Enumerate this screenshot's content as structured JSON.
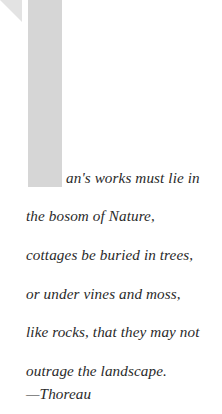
{
  "page": {
    "background_color": "#ffffff",
    "width": 222,
    "height": 414
  },
  "dropcap": {
    "letter": "M",
    "color": "#d6d6d6",
    "flourish_color": "#e3e3e3"
  },
  "quote": {
    "text_color": "#2a2a2a",
    "full_text": "Man's works must lie in the bosom of Nature, cottages be buried in trees, or under vines and moss, like rocks, that they may not outrage the landscape.",
    "lines": [
      "an's works must lie in",
      "the bosom of Nature,",
      "cottages be buried in trees,",
      "or under vines and moss,",
      "like rocks, that they may not",
      "outrage the landscape."
    ],
    "attribution": "—Thoreau"
  }
}
